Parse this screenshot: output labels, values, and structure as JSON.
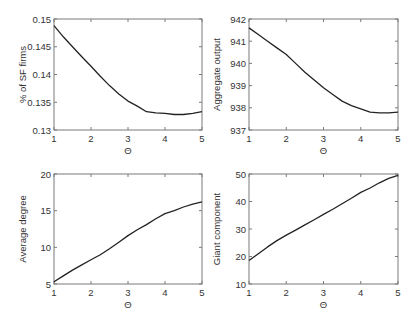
{
  "chart_data": [
    {
      "type": "line",
      "title": "",
      "xlabel": "Θ",
      "ylabel": "% of SF firms",
      "xlim": [
        1,
        5
      ],
      "ylim": [
        0.13,
        0.15
      ],
      "xticks": [
        1,
        2,
        3,
        4,
        5
      ],
      "xtick_labels": [
        "1",
        "2",
        "3",
        "4",
        "5"
      ],
      "yticks": [
        0.13,
        0.135,
        0.14,
        0.145,
        0.15
      ],
      "ytick_labels": [
        "0.13",
        "0.135",
        "0.14",
        "0.145",
        "0.15"
      ],
      "grid": false,
      "legend": "none",
      "series": [
        {
          "name": "% of SF firms",
          "x": [
            1,
            1.25,
            1.5,
            1.75,
            2,
            2.25,
            2.5,
            2.75,
            3,
            3.25,
            3.5,
            3.75,
            4,
            4.25,
            4.5,
            4.75,
            5
          ],
          "y": [
            0.1488,
            0.1468,
            0.145,
            0.1432,
            0.1415,
            0.1397,
            0.138,
            0.1365,
            0.1352,
            0.1343,
            0.1333,
            0.1331,
            0.133,
            0.1328,
            0.1328,
            0.133,
            0.1333
          ]
        }
      ]
    },
    {
      "type": "line",
      "title": "",
      "xlabel": "Θ",
      "ylabel": "Aggregate output",
      "xlim": [
        1,
        5
      ],
      "ylim": [
        937,
        942
      ],
      "xticks": [
        1,
        2,
        3,
        4,
        5
      ],
      "xtick_labels": [
        "1",
        "2",
        "3",
        "4",
        "5"
      ],
      "yticks": [
        937,
        938,
        939,
        940,
        941,
        942
      ],
      "ytick_labels": [
        "937",
        "938",
        "939",
        "940",
        "941",
        "942"
      ],
      "grid": false,
      "legend": "none",
      "series": [
        {
          "name": "Aggregate output",
          "x": [
            1,
            1.25,
            1.5,
            1.75,
            2,
            2.25,
            2.5,
            2.75,
            3,
            3.25,
            3.5,
            3.75,
            4,
            4.25,
            4.5,
            4.75,
            5
          ],
          "y": [
            941.6,
            941.3,
            941.0,
            940.7,
            940.4,
            940.0,
            939.6,
            939.25,
            938.9,
            938.6,
            938.3,
            938.1,
            937.95,
            937.8,
            937.77,
            937.77,
            937.8
          ]
        }
      ]
    },
    {
      "type": "line",
      "title": "",
      "xlabel": "Θ",
      "ylabel": "Average degree",
      "xlim": [
        1,
        5
      ],
      "ylim": [
        5,
        20
      ],
      "xticks": [
        1,
        2,
        3,
        4,
        5
      ],
      "xtick_labels": [
        "1",
        "2",
        "3",
        "4",
        "5"
      ],
      "yticks": [
        5,
        10,
        15,
        20
      ],
      "ytick_labels": [
        "5",
        "10",
        "15",
        "20"
      ],
      "grid": false,
      "legend": "none",
      "series": [
        {
          "name": "Average degree",
          "x": [
            1,
            1.25,
            1.5,
            1.75,
            2,
            2.25,
            2.5,
            2.75,
            3,
            3.25,
            3.5,
            3.75,
            4,
            4.25,
            4.5,
            4.75,
            5
          ],
          "y": [
            5.3,
            6.1,
            6.9,
            7.6,
            8.3,
            9.0,
            9.8,
            10.7,
            11.6,
            12.4,
            13.1,
            13.9,
            14.6,
            15.0,
            15.5,
            15.9,
            16.2
          ]
        }
      ]
    },
    {
      "type": "line",
      "title": "",
      "xlabel": "Θ",
      "ylabel": "Giant component",
      "xlim": [
        1,
        5
      ],
      "ylim": [
        10,
        50
      ],
      "xticks": [
        1,
        2,
        3,
        4,
        5
      ],
      "xtick_labels": [
        "1",
        "2",
        "3",
        "4",
        "5"
      ],
      "yticks": [
        10,
        20,
        30,
        40,
        50
      ],
      "ytick_labels": [
        "10",
        "20",
        "30",
        "40",
        "50"
      ],
      "grid": false,
      "legend": "none",
      "series": [
        {
          "name": "Giant component",
          "x": [
            1,
            1.25,
            1.5,
            1.75,
            2,
            2.25,
            2.5,
            2.75,
            3,
            3.25,
            3.5,
            3.75,
            4,
            4.25,
            4.5,
            4.75,
            5
          ],
          "y": [
            18.5,
            21.0,
            23.5,
            25.8,
            27.8,
            29.6,
            31.5,
            33.4,
            35.3,
            37.2,
            39.2,
            41.2,
            43.3,
            44.9,
            46.8,
            48.4,
            49.5
          ]
        }
      ]
    }
  ]
}
